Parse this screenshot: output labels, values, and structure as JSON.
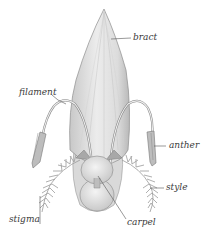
{
  "diagram": {
    "type": "botanical-illustration",
    "labels": {
      "bract": "bract",
      "filament": "filament",
      "anther": "anther",
      "style": "style",
      "stigma": "stigma",
      "carpel": "carpel"
    },
    "colors": {
      "background": "#ffffff",
      "bract_fill": "#e4e4e4",
      "bract_shade": "#bdbdbd",
      "outline": "#8a8a8a",
      "text": "#3a3a3a",
      "leader_line": "#555555"
    }
  }
}
